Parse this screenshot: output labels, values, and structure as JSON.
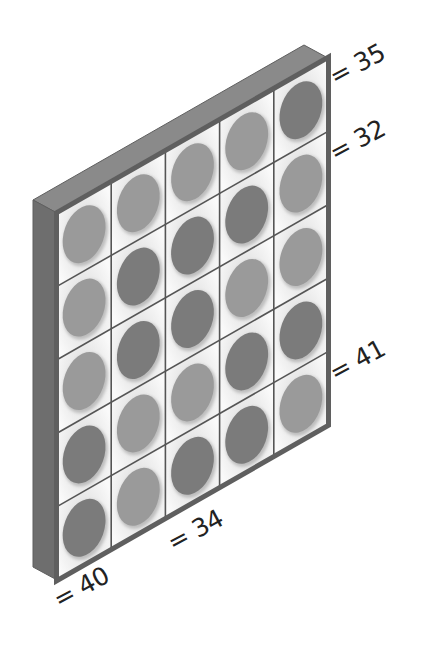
{
  "figure": {
    "grid": {
      "rows": 5,
      "cols": 5,
      "cells": [
        [
          "light",
          "light",
          "light",
          "light",
          "dark"
        ],
        [
          "light",
          "dark",
          "dark",
          "dark",
          "light"
        ],
        [
          "light",
          "dark",
          "dark",
          "light",
          "light"
        ],
        [
          "dark",
          "light",
          "light",
          "dark",
          "dark"
        ],
        [
          "dark",
          "light",
          "dark",
          "dark",
          "light"
        ]
      ]
    },
    "colors": {
      "frame_top": "#8a8a8a",
      "frame_side": "#6e6e6e",
      "frame_border": "#5f5f5f",
      "cell_bg": "#f2f2f2",
      "grid_line": "#555555",
      "disc_light": "#9a9a9a",
      "disc_dark": "#7b7b7b",
      "text": "#222222"
    },
    "labels": {
      "row_top": "= 35",
      "row_second": "= 32",
      "row_bottom_right": "= 41",
      "col_bottom_mid": "= 34",
      "col_bottom_left": "= 40"
    }
  }
}
